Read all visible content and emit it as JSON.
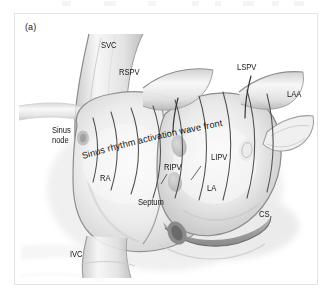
{
  "figure": {
    "panel_letter": "(a)",
    "caption_annotation": "Sinus rhythm activation wave front",
    "view": "Posterior view of the atria showing sinus rhythm activation",
    "style": "grayscale anatomical line-and-wash illustration",
    "border_color": "#e3e3e3",
    "background_color": "#ffffff"
  },
  "labels": {
    "svc": "SVC",
    "rspv": "RSPV",
    "lspv": "LSPV",
    "laa": "LAA",
    "sinus_node_line1": "Sinus",
    "sinus_node_line2": "node",
    "ripv": "RIPV",
    "lipv": "LIPV",
    "ra": "RA",
    "la": "LA",
    "septum": "Septum",
    "cs": "CS",
    "ivc": "IVC"
  },
  "colors": {
    "tissue_light": "#f4f4f4",
    "tissue_mid": "#d8d8d8",
    "tissue_shadow": "#b4b4b4",
    "outline": "#6d6d6d",
    "wave_line": "#4a4a4a",
    "coronary_sinus": "#9a9a9a",
    "text": "#161616"
  }
}
